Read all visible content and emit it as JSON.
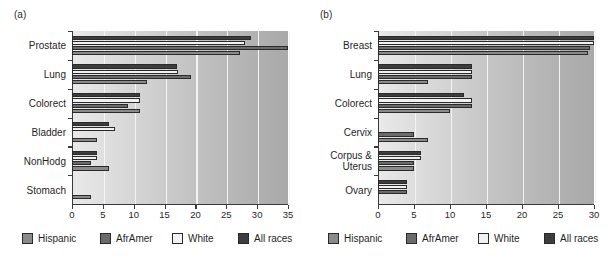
{
  "figure": {
    "panel_a_tag": "(a)",
    "panel_b_tag": "(b)"
  },
  "legend": {
    "items": [
      {
        "label": "Hispanic",
        "color": "#8a8a8a"
      },
      {
        "label": "AfrAmer",
        "color": "#6b6b6b"
      },
      {
        "label": "White",
        "color": "#f2f2f2"
      },
      {
        "label": "All races",
        "color": "#3d3d3d"
      }
    ]
  },
  "chart_data": [
    {
      "type": "bar",
      "title": "(a)",
      "orientation": "horizontal",
      "grouped": true,
      "xlabel": "",
      "ylabel": "",
      "xlim": [
        0,
        35
      ],
      "xticks": [
        0,
        5,
        10,
        15,
        20,
        25,
        30,
        35
      ],
      "xticklabels": [
        "0",
        "5",
        "10",
        "15",
        "20",
        "25",
        "30",
        "35"
      ],
      "grid": true,
      "legend_position": "bottom",
      "categories": [
        "Prostate",
        "Lung",
        "Colorect",
        "Bladder",
        "NonHodg",
        "Stomach"
      ],
      "bar_order_top_to_bottom": [
        "All races",
        "White",
        "AfrAmer",
        "Hispanic"
      ],
      "series": [
        {
          "name": "All races",
          "color": "#3d3d3d",
          "values": [
            29.0,
            17.0,
            11.0,
            6.0,
            4.0,
            0.0
          ]
        },
        {
          "name": "White",
          "color": "#f2f2f2",
          "values": [
            28.0,
            17.2,
            11.0,
            7.0,
            4.0,
            0.0
          ]
        },
        {
          "name": "AfrAmer",
          "color": "#6b6b6b",
          "values": [
            35.0,
            19.3,
            9.0,
            0.0,
            3.0,
            0.0
          ]
        },
        {
          "name": "Hispanic",
          "color": "#8a8a8a",
          "values": [
            27.3,
            12.2,
            11.0,
            4.0,
            6.0,
            3.0
          ]
        }
      ]
    },
    {
      "type": "bar",
      "title": "(b)",
      "orientation": "horizontal",
      "grouped": true,
      "xlabel": "",
      "ylabel": "",
      "xlim": [
        0,
        30
      ],
      "xticks": [
        0,
        5,
        10,
        15,
        20,
        25,
        30
      ],
      "xticklabels": [
        "0",
        "5",
        "10",
        "15",
        "20",
        "25",
        "30"
      ],
      "grid": true,
      "legend_position": "bottom",
      "categories": [
        "Breast",
        "Lung",
        "Colorect",
        "Cervix",
        "Corpus & Uterus",
        "Ovary"
      ],
      "bar_order_top_to_bottom": [
        "All races",
        "White",
        "AfrAmer",
        "Hispanic"
      ],
      "series": [
        {
          "name": "All races",
          "color": "#3d3d3d",
          "values": [
            30.0,
            13.0,
            12.0,
            0.0,
            6.0,
            4.0
          ]
        },
        {
          "name": "White",
          "color": "#f2f2f2",
          "values": [
            30.0,
            13.0,
            13.0,
            0.0,
            6.0,
            4.0
          ]
        },
        {
          "name": "AfrAmer",
          "color": "#6b6b6b",
          "values": [
            29.5,
            13.0,
            13.0,
            5.0,
            5.0,
            4.0
          ]
        },
        {
          "name": "Hispanic",
          "color": "#8a8a8a",
          "values": [
            29.2,
            7.0,
            10.0,
            7.0,
            5.0,
            0.0
          ]
        }
      ]
    }
  ]
}
